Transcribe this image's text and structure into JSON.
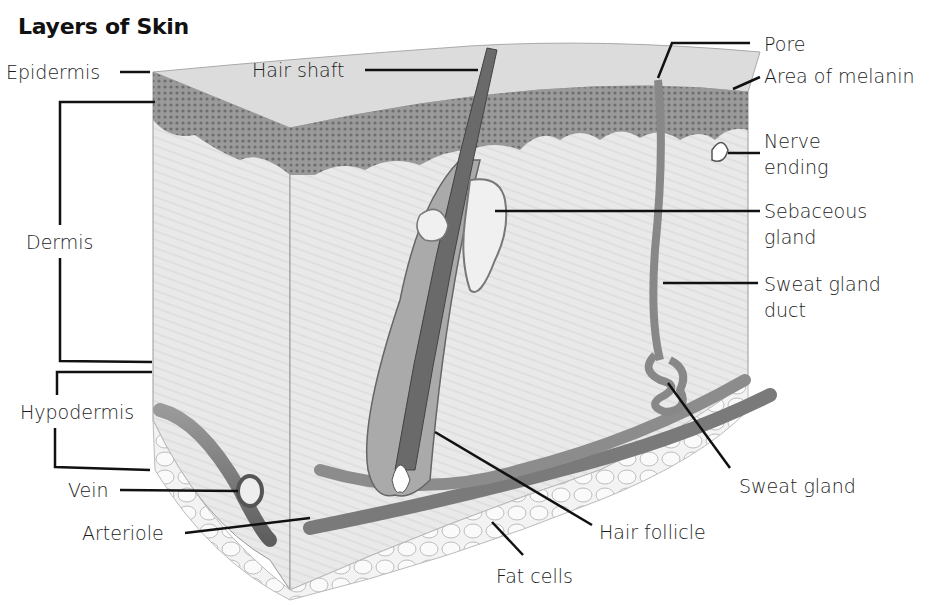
{
  "title": "Layers of Skin",
  "left_labels": {
    "epidermis": "Epidermis",
    "dermis": "Dermis",
    "hypodermis": "Hypodermis",
    "vein": "Vein",
    "arteriole": "Arteriole"
  },
  "top_labels": {
    "hair_shaft": "Hair shaft"
  },
  "right_labels": {
    "pore": "Pore",
    "area_of_melanin": "Area of melanin",
    "nerve_ending_line1": "Nerve",
    "nerve_ending_line2": "ending",
    "sebaceous_gland_line1": "Sebaceous",
    "sebaceous_gland_line2": "gland",
    "sweat_gland_duct_line1": "Sweat gland",
    "sweat_gland_duct_line2": "duct",
    "sweat_gland": "Sweat gland"
  },
  "bottom_labels": {
    "hair_follicle": "Hair follicle",
    "fat_cells": "Fat cells"
  },
  "colors": {
    "ink": "#111111",
    "epidermis": "#8a8a8a",
    "dermis": "#e8e8e8",
    "vessel": "#7a7a7a",
    "fat": "#f2f2f2"
  }
}
